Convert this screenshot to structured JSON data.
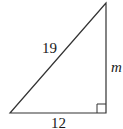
{
  "diagram": {
    "type": "right-triangle",
    "labels": {
      "hypotenuse": "19",
      "vertical_leg": "m",
      "base": "12"
    },
    "right_angle_marker": "bottom-right",
    "stroke_color": "#333333"
  }
}
